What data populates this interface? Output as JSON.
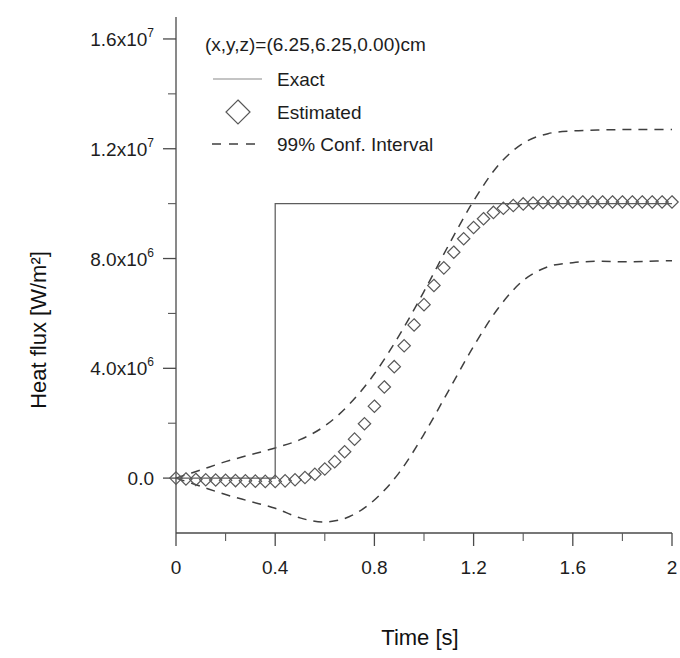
{
  "chart_data": {
    "type": "line",
    "title": "",
    "xlabel": "Time [s]",
    "ylabel": "Heat flux [W/m²]",
    "annotation": "(x,y,z)=(6.25,6.25,0.00)cm",
    "xlim": [
      0,
      2
    ],
    "ylim": [
      -2000000,
      16800000
    ],
    "grid": false,
    "legend_position": "top-center",
    "x_ticks": [
      "0",
      "0.4",
      "0.8",
      "1.2",
      "1.6",
      "2"
    ],
    "x_tick_values": [
      0,
      0.4,
      0.8,
      1.2,
      1.6,
      2
    ],
    "x_minor_ticks": [
      0.2,
      0.6,
      1.0,
      1.4,
      1.8
    ],
    "y_ticks": [
      {
        "mantissa": "0.0",
        "exponent": "",
        "value": 0
      },
      {
        "mantissa": "4.0x10",
        "exponent": "6",
        "value": 4000000
      },
      {
        "mantissa": "8.0x10",
        "exponent": "6",
        "value": 8000000
      },
      {
        "mantissa": "1.2x10",
        "exponent": "7",
        "value": 12000000
      },
      {
        "mantissa": "1.6x10",
        "exponent": "7",
        "value": 16000000
      }
    ],
    "y_minor_tick_values": [
      2000000,
      6000000,
      10000000,
      14000000
    ],
    "legend": [
      {
        "label": "Exact",
        "marker": "line"
      },
      {
        "label": "Estimated",
        "marker": "diamond"
      },
      {
        "label": "99% Conf. Interval",
        "marker": "dashed-line"
      }
    ],
    "series": [
      {
        "name": "Exact",
        "type": "step",
        "x": [
          0,
          0.4,
          0.4,
          2.0
        ],
        "y": [
          0,
          0,
          10000000,
          10000000
        ]
      },
      {
        "name": "Estimated",
        "type": "markers",
        "marker": "diamond",
        "x": [
          0.0,
          0.04,
          0.08,
          0.12,
          0.16,
          0.2,
          0.24,
          0.28,
          0.32,
          0.36,
          0.4,
          0.44,
          0.48,
          0.52,
          0.56,
          0.6,
          0.64,
          0.68,
          0.72,
          0.76,
          0.8,
          0.84,
          0.88,
          0.92,
          0.96,
          1.0,
          1.04,
          1.08,
          1.12,
          1.16,
          1.2,
          1.24,
          1.28,
          1.32,
          1.36,
          1.4,
          1.44,
          1.48,
          1.52,
          1.56,
          1.6,
          1.64,
          1.68,
          1.72,
          1.76,
          1.8,
          1.84,
          1.88,
          1.92,
          1.96,
          2.0
        ],
        "y": [
          0,
          -30000,
          -50000,
          -60000,
          -70000,
          -80000,
          -90000,
          -100000,
          -110000,
          -120000,
          -120000,
          -100000,
          -60000,
          20000,
          140000,
          330000,
          600000,
          960000,
          1420000,
          1980000,
          2620000,
          3320000,
          4060000,
          4820000,
          5580000,
          6320000,
          7020000,
          7660000,
          8230000,
          8720000,
          9130000,
          9450000,
          9680000,
          9830000,
          9930000,
          9990000,
          10020000,
          10040000,
          10050000,
          10050000,
          10060000,
          10060000,
          10060000,
          10060000,
          10060000,
          10060000,
          10060000,
          10060000,
          10060000,
          10060000,
          10060000
        ]
      },
      {
        "name": "99% Conf. Interval Upper",
        "type": "dashed",
        "x": [
          0.0,
          0.1,
          0.2,
          0.3,
          0.4,
          0.5,
          0.6,
          0.7,
          0.8,
          0.9,
          1.0,
          1.1,
          1.2,
          1.3,
          1.4,
          1.5,
          1.6,
          1.7,
          1.8,
          1.9,
          2.0
        ],
        "y": [
          0,
          300000,
          600000,
          850000,
          1100000,
          1400000,
          1900000,
          2700000,
          3800000,
          5200000,
          6800000,
          8500000,
          10100000,
          11400000,
          12200000,
          12550000,
          12650000,
          12680000,
          12700000,
          12700000,
          12700000
        ]
      },
      {
        "name": "99% Conf. Interval Lower",
        "type": "dashed",
        "x": [
          0.0,
          0.1,
          0.2,
          0.3,
          0.4,
          0.5,
          0.6,
          0.7,
          0.8,
          0.9,
          1.0,
          1.1,
          1.2,
          1.3,
          1.4,
          1.5,
          1.6,
          1.7,
          1.8,
          1.9,
          2.0
        ],
        "y": [
          0,
          -300000,
          -600000,
          -850000,
          -1100000,
          -1450000,
          -1600000,
          -1400000,
          -800000,
          200000,
          1600000,
          3200000,
          4800000,
          6200000,
          7200000,
          7700000,
          7850000,
          7900000,
          7880000,
          7900000,
          7920000
        ]
      }
    ]
  }
}
